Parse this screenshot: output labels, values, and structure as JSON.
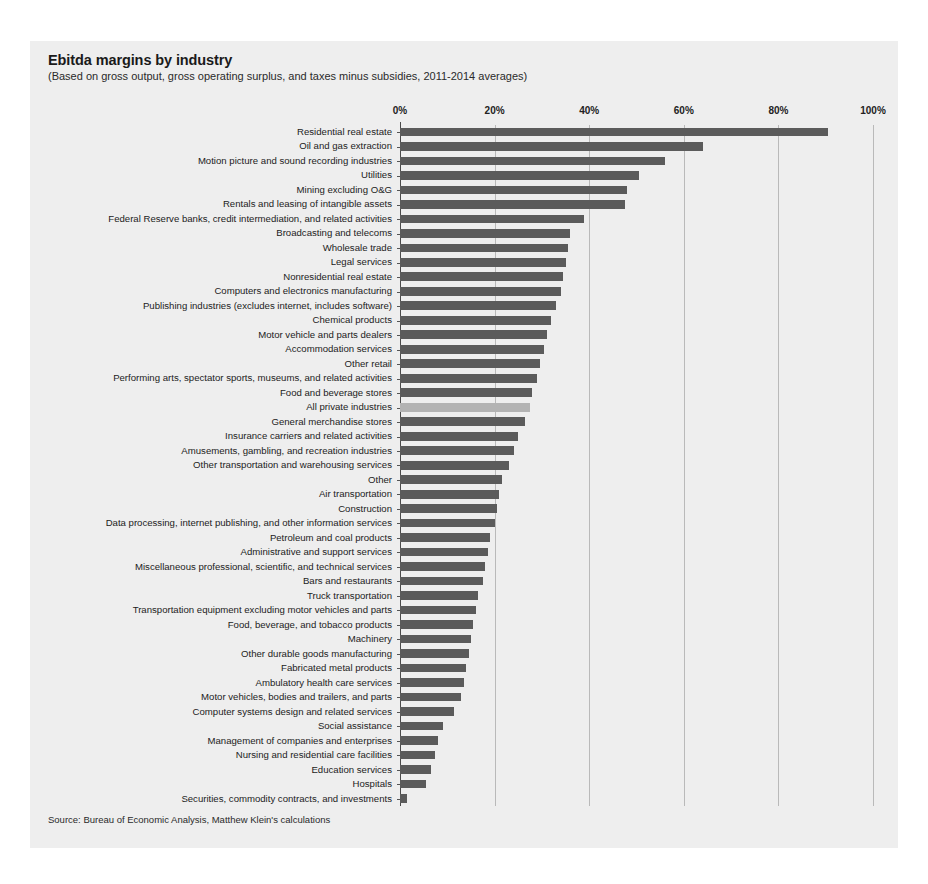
{
  "chart": {
    "title": "Ebitda margins by industry",
    "subtitle": "(Based on gross output, gross operating surplus, and taxes minus subsidies, 2011-2014 averages)",
    "source": "Source: Bureau of Economic Analysis, Matthew Klein's calculations"
  },
  "chart_data": {
    "type": "bar",
    "orientation": "horizontal",
    "title": "Ebitda margins by industry",
    "subtitle": "(Based on gross output, gross operating surplus, and taxes minus subsidies, 2011-2014 averages)",
    "xlabel": "",
    "ylabel": "",
    "xlim": [
      0,
      100
    ],
    "xticks": [
      0,
      20,
      40,
      60,
      80,
      100
    ],
    "xticklabels": [
      "0%",
      "20%",
      "40%",
      "60%",
      "80%",
      "100%"
    ],
    "grid": "vertical",
    "legend": "none",
    "bar_color": "#5b5b5b",
    "highlight_color": "#b3b3b3",
    "highlight_category": "All private industries",
    "source": "Source: Bureau of Economic Analysis, Matthew Klein's calculations",
    "categories": [
      "Residential real estate",
      "Oil and gas extraction",
      "Motion picture and sound recording industries",
      "Utilities",
      "Mining excluding O&G",
      "Rentals and leasing of intangible assets",
      "Federal Reserve banks, credit intermediation, and related activities",
      "Broadcasting and telecoms",
      "Wholesale trade",
      "Legal services",
      "Nonresidential real estate",
      "Computers and electronics manufacturing",
      "Publishing industries (excludes internet, includes software)",
      "Chemical products",
      "Motor vehicle and parts dealers",
      "Accommodation services",
      "Other retail",
      "Performing arts, spectator sports, museums, and related activities",
      "Food and beverage stores",
      "All private industries",
      "General merchandise stores",
      "Insurance carriers and related activities",
      "Amusements, gambling, and recreation industries",
      "Other transportation and warehousing services",
      "Other",
      "Air transportation",
      "Construction",
      "Data processing, internet publishing, and other information services",
      "Petroleum and coal products",
      "Administrative and support services",
      "Miscellaneous professional, scientific, and technical services",
      "Bars and restaurants",
      "Truck transportation",
      "Transportation equipment excluding motor vehicles and parts",
      "Food, beverage, and tobacco products",
      "Machinery",
      "Other durable goods manufacturing",
      "Fabricated metal products",
      "Ambulatory health care services",
      "Motor vehicles, bodies and trailers, and parts",
      "Computer systems design and related services",
      "Social assistance",
      "Management of companies and enterprises",
      "Nursing and residential care facilities",
      "Education services",
      "Hospitals",
      "Securities, commodity contracts, and investments"
    ],
    "values": [
      90.5,
      64.0,
      56.0,
      50.5,
      48.0,
      47.5,
      39.0,
      36.0,
      35.5,
      35.0,
      34.5,
      34.0,
      33.0,
      32.0,
      31.0,
      30.5,
      29.5,
      29.0,
      28.0,
      27.5,
      26.5,
      25.0,
      24.0,
      23.0,
      21.5,
      21.0,
      20.5,
      20.0,
      19.0,
      18.5,
      18.0,
      17.5,
      16.5,
      16.0,
      15.5,
      15.0,
      14.5,
      14.0,
      13.5,
      13.0,
      11.5,
      9.0,
      8.0,
      7.5,
      6.5,
      5.5,
      1.5
    ]
  }
}
